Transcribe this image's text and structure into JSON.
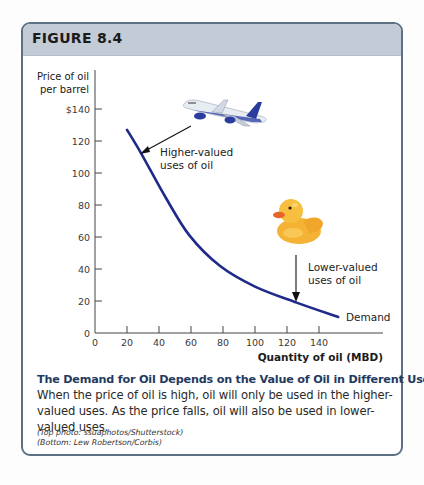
{
  "figure": {
    "label": "FIGURE 8.4",
    "colors": {
      "header_bg": "#c3ccd6",
      "border": "#5d7185",
      "curve": "#1f2a8a",
      "caption_title": "#1f3a5f",
      "plane_body": "#e8ecf3",
      "plane_engine": "#2a3d9e",
      "duck_body": "#f7b733",
      "duck_beak": "#e8652a"
    }
  },
  "chart_data": {
    "type": "line",
    "title": "",
    "ylabel": "Price of oil per barrel",
    "ylabel_lines": [
      "Price of oil",
      "per barrel"
    ],
    "xlabel": "Quantity of oil (MBD)",
    "xlim": [
      0,
      180
    ],
    "ylim": [
      0,
      140
    ],
    "grid": false,
    "x_ticks": [
      "0",
      "20",
      "40",
      "60",
      "80",
      "100",
      "120",
      "140"
    ],
    "y_ticks": [
      "0",
      "20",
      "40",
      "60",
      "80",
      "100",
      "120",
      "$140"
    ],
    "series": [
      {
        "name": "Demand",
        "x": [
          20,
          29,
          44,
          59,
          78,
          100,
          126,
          152
        ],
        "y": [
          127,
          112,
          85,
          61,
          42,
          29,
          19,
          10
        ]
      }
    ],
    "annotations": [
      {
        "text_lines": [
          "Higher-valued",
          "uses of oil"
        ],
        "points_to": [
          29,
          112
        ],
        "icon": "airplane"
      },
      {
        "text_lines": [
          "Lower-valued",
          "uses of oil"
        ],
        "points_to": [
          126,
          19
        ],
        "icon": "rubber-duck"
      },
      {
        "text": "Demand",
        "at": [
          160,
          10
        ]
      }
    ]
  },
  "caption": {
    "title": "The Demand for Oil Depends on the Value of Oil in Different Uses",
    "body": "When the price of oil is high, oil will only be used in the higher-valued uses. As the price falls, oil will also be used in lower-valued uses.",
    "credits": [
      "(Top photo: ssuaphotos/Shutterstock)",
      "(Bottom: Lew Robertson/Corbis)"
    ]
  }
}
